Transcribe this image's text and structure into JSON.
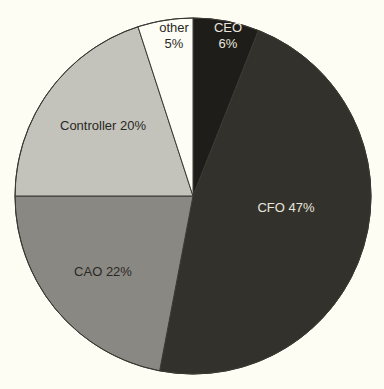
{
  "chart_data": {
    "type": "pie",
    "title": "",
    "start_angle_deg": 0,
    "direction": "clockwise",
    "center": [
      193,
      196
    ],
    "radius": 178,
    "categories": [
      "CEO",
      "CFO",
      "CAO",
      "Controller",
      "other"
    ],
    "values": [
      6,
      47,
      22,
      20,
      5
    ],
    "unit": "%",
    "slices": [
      {
        "label": "CEO",
        "value": 6,
        "display": [
          "CEO",
          "6%"
        ],
        "color": "#1f1d19",
        "text_color": "#e8e6dc",
        "label_pos": [
          228,
          32
        ]
      },
      {
        "label": "CFO",
        "value": 47,
        "display": [
          "CFO 47%"
        ],
        "color": "#33312b",
        "text_color": "#e8e6dc",
        "label_pos": [
          286,
          212
        ]
      },
      {
        "label": "CAO",
        "value": 22,
        "display": [
          "CAO 22%"
        ],
        "color": "#8a8883",
        "text_color": "#2a2824",
        "label_pos": [
          103,
          276
        ]
      },
      {
        "label": "Controller",
        "value": 20,
        "display": [
          "Controller 20%"
        ],
        "color": "#c3c2bb",
        "text_color": "#2a2824",
        "label_pos": [
          103,
          130
        ]
      },
      {
        "label": "other",
        "value": 5,
        "display": [
          "other",
          "5%"
        ],
        "color": "#fdfdf5",
        "text_color": "#2a2824",
        "label_pos": [
          174,
          32
        ]
      }
    ],
    "legend": null,
    "grid": false
  }
}
